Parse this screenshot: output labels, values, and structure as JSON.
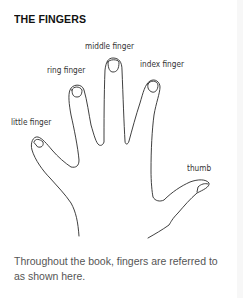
{
  "title": "THE FINGERS",
  "labels": {
    "middle": "middle finger",
    "ring": "ring finger",
    "index": "index finger",
    "little": "little finger",
    "thumb": "thumb"
  },
  "caption": "Throughout the book, fingers are referred to as shown here.",
  "colors": {
    "outline": "#2a2a2a",
    "text": "#333333",
    "caption": "#555555"
  }
}
